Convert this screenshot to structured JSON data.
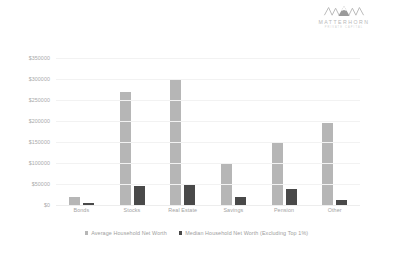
{
  "brand": {
    "mark_icon": "mountain-logo-icon",
    "name": "MATTERHORN",
    "tagline": "PRIVATE CAPITAL"
  },
  "chart_data": {
    "type": "bar",
    "title": "",
    "subtitle": "",
    "xlabel": "",
    "ylabel": "",
    "categories": [
      "Bonds",
      "Stocks",
      "Real Estate",
      "Savings",
      "Pension",
      "Other"
    ],
    "series": [
      {
        "name": "Average Household Net Worth",
        "color": "#b6b6b6",
        "values": [
          20000,
          270000,
          300000,
          100000,
          148000,
          195000
        ]
      },
      {
        "name": "Median Household Net Worth (Excluding Top 1%)",
        "color": "#494949",
        "values": [
          5000,
          45000,
          50000,
          18000,
          37000,
          13000
        ]
      }
    ],
    "ylim": [
      0,
      350000
    ],
    "ytick_values": [
      350000,
      300000,
      250000,
      200000,
      150000,
      100000,
      50000,
      0
    ],
    "ytick_labels": [
      "$350000",
      "$300000",
      "$250000",
      "$200000",
      "$150000",
      "$100000",
      "$50000",
      "$0"
    ],
    "grid": true,
    "legend_position": "bottom"
  }
}
